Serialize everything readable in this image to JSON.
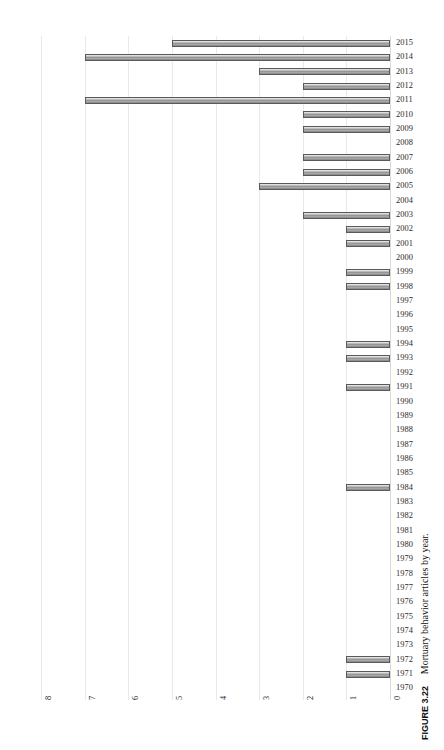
{
  "figure": {
    "number_label": "FIGURE 3.22",
    "caption_text": "Mortuary behavior articles by year."
  },
  "chart_data": {
    "type": "bar",
    "orientation": "horizontal",
    "title": "Mortuary behavior articles by year.",
    "xlabel": "",
    "ylabel": "",
    "xlim": [
      8,
      0
    ],
    "x_axis_reversed": true,
    "x_ticks": [
      "8",
      "7",
      "6",
      "5",
      "4",
      "3",
      "2",
      "1",
      "0"
    ],
    "x_tick_values": [
      8,
      7,
      6,
      5,
      4,
      3,
      2,
      1,
      0
    ],
    "grid": true,
    "legend": null,
    "bar_color": "#9a9a9a",
    "bar_edge_color": "#5a5a5a",
    "categories": [
      "2015",
      "2014",
      "2013",
      "2012",
      "2011",
      "2010",
      "2009",
      "2008",
      "2007",
      "2006",
      "2005",
      "2004",
      "2003",
      "2002",
      "2001",
      "2000",
      "1999",
      "1998",
      "1997",
      "1996",
      "1995",
      "1994",
      "1993",
      "1992",
      "1991",
      "1990",
      "1989",
      "1988",
      "1987",
      "1986",
      "1985",
      "1984",
      "1983",
      "1982",
      "1981",
      "1980",
      "1979",
      "1978",
      "1977",
      "1976",
      "1975",
      "1974",
      "1973",
      "1972",
      "1971",
      "1970"
    ],
    "values": [
      5,
      7,
      3,
      2,
      7,
      2,
      2,
      0,
      2,
      2,
      3,
      0,
      2,
      1,
      1,
      0,
      1,
      1,
      0,
      0,
      0,
      1,
      1,
      0,
      1,
      0,
      0,
      0,
      0,
      0,
      0,
      1,
      0,
      0,
      0,
      0,
      0,
      0,
      0,
      0,
      0,
      0,
      0,
      1,
      1,
      0
    ]
  },
  "geometry": {
    "zero_x": 390,
    "unit_px": 43.6,
    "top_y": 36,
    "row_h": 14.34
  }
}
